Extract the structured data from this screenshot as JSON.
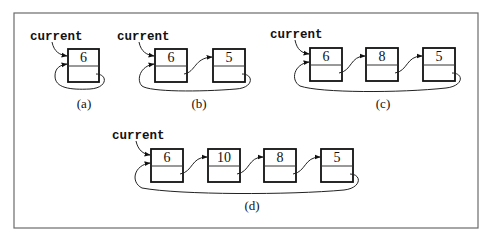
{
  "diagram": {
    "type": "circular-singly-linked-list",
    "pointer_label": "current",
    "colors": {
      "frame": "#6b6b6b",
      "box_stroke": "#111111",
      "background": "#ffffff"
    },
    "panels": [
      {
        "id": "a",
        "caption": "(a)",
        "nodes": [
          "6"
        ]
      },
      {
        "id": "b",
        "caption": "(b)",
        "nodes": [
          "6",
          "5"
        ]
      },
      {
        "id": "c",
        "caption": "(c)",
        "nodes": [
          "6",
          "8",
          "5"
        ]
      },
      {
        "id": "d",
        "caption": "(d)",
        "nodes": [
          "6",
          "10",
          "8",
          "5"
        ]
      }
    ]
  }
}
